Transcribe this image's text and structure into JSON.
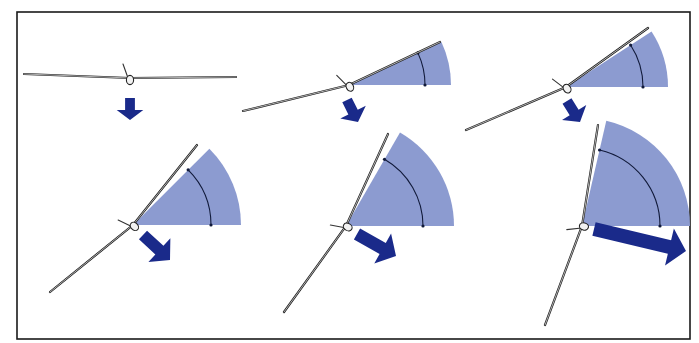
{
  "figure": {
    "colors": {
      "sector": "#8c9bd0",
      "arrow": "#1a2a8a",
      "frame": "#1a1a1a",
      "background": "#ffffff"
    },
    "frame": {
      "x": 17,
      "y": 12,
      "width": 673,
      "height": 327
    },
    "panels": [
      {
        "id": "panel-1",
        "pivot": [
          130,
          78
        ],
        "bank_deg": 0,
        "wing_left": [
          24,
          74
        ],
        "wing_right": [
          236,
          77
        ],
        "sector_radius": 0,
        "arrow": {
          "from": [
            130,
            98
          ],
          "to": [
            130,
            120
          ],
          "width": 14
        }
      },
      {
        "id": "panel-2",
        "pivot": [
          349,
          85
        ],
        "bank_deg": 25,
        "wing_left": [
          243,
          111
        ],
        "wing_right": [
          440,
          42
        ],
        "sector_radius": 102,
        "arc_radius": 76,
        "arrow": {
          "from": [
            347,
            100
          ],
          "to": [
            358,
            122
          ],
          "width": 15
        }
      },
      {
        "id": "panel-3",
        "pivot": [
          566,
          87
        ],
        "bank_deg": 33,
        "wing_left": [
          466,
          130
        ],
        "wing_right": [
          648,
          28
        ],
        "sector_radius": 102,
        "arc_radius": 77,
        "arrow": {
          "from": [
            567,
            101
          ],
          "to": [
            580,
            122
          ],
          "width": 15
        }
      },
      {
        "id": "panel-4",
        "pivot": [
          133,
          225
        ],
        "bank_deg": 45,
        "wing_left": [
          50,
          292
        ],
        "wing_right": [
          197,
          145
        ],
        "sector_radius": 108,
        "arc_radius": 78,
        "arrow": {
          "from": [
            143,
            235
          ],
          "to": [
            170,
            260
          ],
          "width": 17
        }
      },
      {
        "id": "panel-5",
        "pivot": [
          346,
          226
        ],
        "bank_deg": 60,
        "wing_left": [
          284,
          312
        ],
        "wing_right": [
          388,
          134
        ],
        "sector_radius": 108,
        "arc_radius": 77,
        "arrow": {
          "from": [
            357,
            234
          ],
          "to": [
            396,
            256
          ],
          "width": 18
        }
      },
      {
        "id": "panel-6",
        "pivot": [
          582,
          226
        ],
        "bank_deg": 77,
        "wing_left": [
          545,
          325
        ],
        "wing_right": [
          598,
          125
        ],
        "sector_radius": 108,
        "arc_radius": 78,
        "arrow": {
          "from": [
            594,
            229
          ],
          "to": [
            686,
            251
          ],
          "width": 20
        }
      }
    ]
  }
}
